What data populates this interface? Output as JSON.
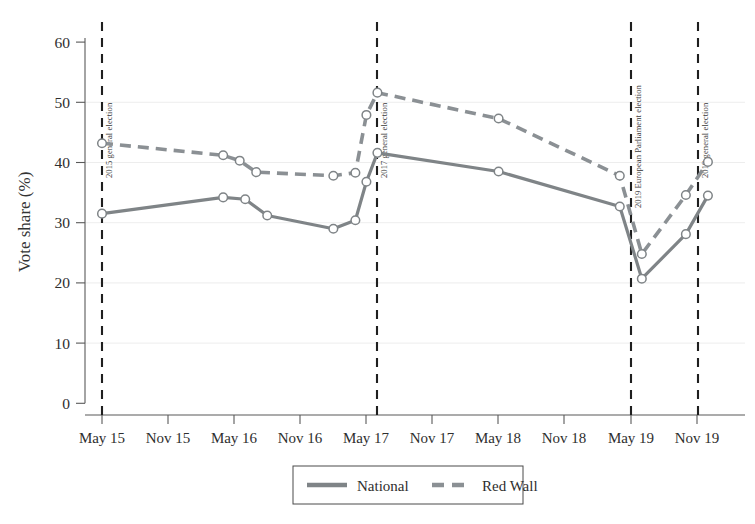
{
  "chart_data": {
    "type": "line",
    "title": "",
    "xlabel": "",
    "ylabel": "Vote share (%)",
    "ylim": [
      0,
      62
    ],
    "yticks": [
      0,
      10,
      20,
      30,
      40,
      50,
      60
    ],
    "ytick_labels": [
      "0",
      "10",
      "20",
      "30",
      "40",
      "50",
      "60"
    ],
    "xticks": [
      "May 15",
      "Nov 15",
      "May 16",
      "Nov 16",
      "May 17",
      "Nov 17",
      "May 18",
      "Nov 18",
      "May 19",
      "Nov 19"
    ],
    "grid": "horizontal-light",
    "legend_position": "bottom-center",
    "x_unit": "months since May 2015",
    "series": [
      {
        "name": "National",
        "style": "solid",
        "color": "#7f8487",
        "points": [
          {
            "x": "May 15",
            "x_m": 0,
            "y": 31.5
          },
          {
            "x": "Apr 16",
            "x_m": 11,
            "y": 34.2
          },
          {
            "x": "Jun 16",
            "x_m": 13,
            "y": 33.9
          },
          {
            "x": "Aug 16",
            "x_m": 15,
            "y": 31.2
          },
          {
            "x": "Feb 17",
            "x_m": 21,
            "y": 29.0
          },
          {
            "x": "Apr 17",
            "x_m": 23,
            "y": 30.4
          },
          {
            "x": "May 17",
            "x_m": 24,
            "y": 36.8
          },
          {
            "x": "Jun 17",
            "x_m": 25,
            "y": 41.6
          },
          {
            "x": "May 18",
            "x_m": 36,
            "y": 38.5
          },
          {
            "x": "Apr 19",
            "x_m": 47,
            "y": 32.7
          },
          {
            "x": "May 19",
            "x_m": 49,
            "y": 20.7
          },
          {
            "x": "Oct 19",
            "x_m": 53,
            "y": 28.1
          },
          {
            "x": "Dec 19",
            "x_m": 55,
            "y": 34.5
          }
        ]
      },
      {
        "name": "Red Wall",
        "style": "dashed",
        "color": "#8b9094",
        "points": [
          {
            "x": "May 15",
            "x_m": 0,
            "y": 43.2
          },
          {
            "x": "Apr 16",
            "x_m": 11,
            "y": 41.2
          },
          {
            "x": "Jun 16",
            "x_m": 12.5,
            "y": 40.3
          },
          {
            "x": "Aug 16",
            "x_m": 14,
            "y": 38.4
          },
          {
            "x": "Feb 17",
            "x_m": 21,
            "y": 37.8
          },
          {
            "x": "Apr 17",
            "x_m": 23,
            "y": 38.3
          },
          {
            "x": "May 17",
            "x_m": 24,
            "y": 47.9
          },
          {
            "x": "Jun 17",
            "x_m": 25,
            "y": 51.6
          },
          {
            "x": "May 18",
            "x_m": 36,
            "y": 47.3
          },
          {
            "x": "Apr 19",
            "x_m": 47,
            "y": 37.8
          },
          {
            "x": "May 19",
            "x_m": 49,
            "y": 24.8
          },
          {
            "x": "Oct 19",
            "x_m": 53,
            "y": 34.6
          },
          {
            "x": "Dec 19",
            "x_m": 55,
            "y": 40.1
          }
        ]
      }
    ],
    "annotations": [
      {
        "label": "2015 general election",
        "x": "May 15",
        "x_m": 0,
        "type": "vline"
      },
      {
        "label": "2017 general election",
        "x": "Jun 17",
        "x_m": 25,
        "type": "vline"
      },
      {
        "label": "2019 European Parliament election",
        "x": "May 19",
        "x_m": 49,
        "type": "vline"
      },
      {
        "label": "2019 general election",
        "x": "Dec 19",
        "x_m": 55,
        "type": "vline"
      }
    ],
    "legend": [
      {
        "label": "National",
        "style": "solid",
        "color": "#7f8487"
      },
      {
        "label": "Red Wall",
        "style": "dashed",
        "color": "#8b9094"
      }
    ]
  }
}
